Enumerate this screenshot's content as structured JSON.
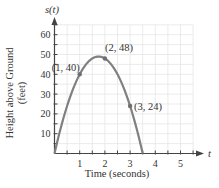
{
  "chart_data": {
    "type": "line",
    "title": "",
    "function": "s(t) = -16t^2 + 56t",
    "xlabel": "Time (seconds)",
    "ylabel": "Height above Ground (feet)",
    "ylabel_lines": [
      "Height above Ground",
      "(feet)"
    ],
    "x_axis_symbol": "t",
    "y_axis_symbol": "s(t)",
    "xlim": [
      0,
      5.5
    ],
    "ylim": [
      0,
      65
    ],
    "x_ticks": [
      1,
      2,
      3,
      4,
      5
    ],
    "y_ticks": [
      10,
      20,
      30,
      40,
      50,
      60
    ],
    "grid": true,
    "curve_color": "#808080",
    "grid_color": "#e6e6e6",
    "series": [
      {
        "name": "s(t)",
        "x": [
          0,
          0.5,
          1,
          1.5,
          1.75,
          2,
          2.5,
          3,
          3.5
        ],
        "values": [
          0,
          24,
          40,
          48,
          49,
          48,
          40,
          24,
          0
        ]
      }
    ],
    "annotations": [
      {
        "label": "(1, 40)",
        "x": 1,
        "y": 40
      },
      {
        "label": "(2, 48)",
        "x": 2,
        "y": 48
      },
      {
        "label": "(3, 24)",
        "x": 3,
        "y": 24
      }
    ]
  }
}
